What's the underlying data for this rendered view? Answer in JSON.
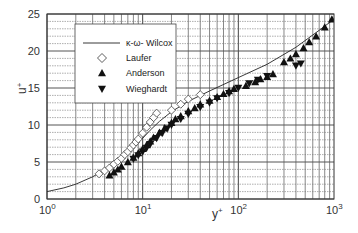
{
  "chart_data": {
    "type": "scatter",
    "title": "",
    "xlabel": "y+",
    "ylabel": "u+",
    "xscale": "log",
    "xlim": [
      1,
      1000
    ],
    "ylim": [
      0,
      25
    ],
    "grid": true,
    "x_ticks": [
      {
        "base": "10",
        "exp": "0"
      },
      {
        "base": "10",
        "exp": "1"
      },
      {
        "base": "10",
        "exp": "2"
      },
      {
        "base": "10",
        "exp": "3"
      }
    ],
    "y_ticks": [
      "0",
      "5",
      "10",
      "15",
      "20",
      "25"
    ],
    "legend_position": "upper-left",
    "legend": [
      {
        "label": "κ-ω- Wilcox",
        "marker": "line"
      },
      {
        "label": "Laufer",
        "marker": "open-diamond"
      },
      {
        "label": "Anderson",
        "marker": "filled-triangle-up"
      },
      {
        "label": "Wieghardt",
        "marker": "filled-triangle-down"
      }
    ],
    "series": [
      {
        "name": "κ-ω- Wilcox",
        "type": "line",
        "x": [
          1,
          1.5,
          2,
          3,
          4,
          5,
          6,
          8,
          10,
          12,
          15,
          20,
          30,
          50,
          100,
          200,
          400,
          700,
          1000
        ],
        "y": [
          1.0,
          1.5,
          2.0,
          3.0,
          3.9,
          4.8,
          5.6,
          7.0,
          8.2,
          9.3,
          10.5,
          11.8,
          13.2,
          14.6,
          16.4,
          18.2,
          20.5,
          22.8,
          24.3
        ]
      },
      {
        "name": "Laufer",
        "type": "scatter",
        "x": [
          3.5,
          4,
          4.5,
          5,
          5.5,
          6,
          6.5,
          7,
          7.5,
          8,
          8.5,
          9,
          10,
          11,
          12,
          13,
          14,
          20,
          25,
          30,
          40
        ],
        "y": [
          3.4,
          3.8,
          4.2,
          4.7,
          5.1,
          5.5,
          6.0,
          6.4,
          6.9,
          7.3,
          7.7,
          8.1,
          8.9,
          9.7,
          10.4,
          11.0,
          11.6,
          12.0,
          12.8,
          13.5,
          14.1
        ]
      },
      {
        "name": "Anderson",
        "type": "scatter",
        "x": [
          4.5,
          5,
          5.5,
          6,
          7,
          8,
          9,
          10,
          11,
          12,
          13,
          15,
          17,
          20,
          22,
          25,
          30,
          35,
          40,
          50,
          60,
          70,
          80,
          90,
          120,
          150,
          170,
          200,
          230,
          300,
          350,
          400,
          480,
          550,
          650,
          800,
          950
        ],
        "y": [
          3.2,
          3.6,
          4.0,
          4.4,
          5.0,
          5.6,
          6.2,
          6.8,
          7.3,
          7.8,
          8.3,
          9.0,
          9.6,
          10.3,
          10.8,
          11.2,
          11.9,
          12.3,
          12.8,
          13.3,
          13.8,
          14.2,
          14.6,
          14.9,
          15.3,
          15.8,
          16.2,
          16.5,
          16.9,
          18.5,
          19.0,
          19.6,
          20.4,
          21.2,
          22.0,
          23.2,
          24.3
        ]
      },
      {
        "name": "Wieghardt",
        "type": "scatter",
        "x": [
          8,
          9,
          10,
          11,
          12,
          14,
          16,
          18,
          20,
          25,
          30,
          40,
          50,
          60,
          80,
          100,
          130,
          160,
          200,
          400,
          450
        ],
        "y": [
          5.4,
          5.9,
          6.4,
          6.9,
          7.4,
          8.2,
          8.9,
          9.5,
          10.0,
          10.8,
          11.5,
          12.4,
          13.0,
          13.6,
          14.3,
          15.0,
          15.6,
          16.1,
          16.6,
          18.0,
          18.3
        ]
      }
    ]
  }
}
